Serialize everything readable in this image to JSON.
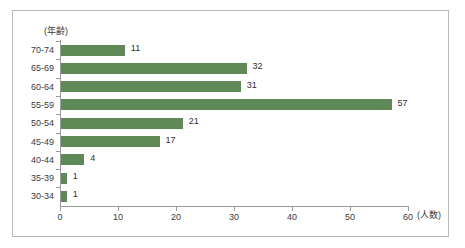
{
  "chart_data": {
    "type": "bar",
    "orientation": "horizontal",
    "title": "",
    "xlabel": "(人数)",
    "ylabel": "(年齢)",
    "categories": [
      "70-74",
      "65-69",
      "60-64",
      "55-59",
      "50-54",
      "45-49",
      "40-44",
      "35-39",
      "30-34"
    ],
    "values": [
      11,
      32,
      31,
      57,
      21,
      17,
      4,
      1,
      1
    ],
    "xlim": [
      0,
      60
    ],
    "xticks": [
      0,
      10,
      20,
      30,
      40,
      50,
      60
    ],
    "xtick_labels": [
      "0",
      "10",
      "20",
      "30",
      "40",
      "50",
      "60"
    ],
    "grid": false,
    "legend": null,
    "bar_color": "#5f8a58",
    "axis_color": "#9a9a9a",
    "text_color": "#3a3a3a",
    "border_color": "#b9b9b9",
    "background": "#ffffff",
    "data_labels": [
      "11",
      "32",
      "31",
      "57",
      "21",
      "17",
      "4",
      "1",
      "1"
    ]
  }
}
